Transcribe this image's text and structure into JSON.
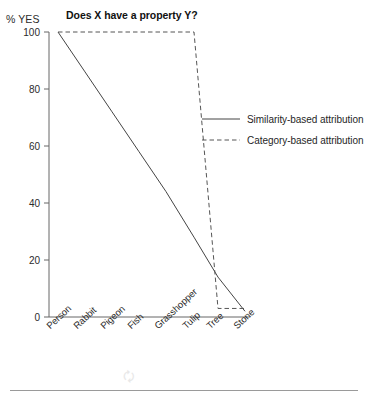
{
  "chart_data": {
    "type": "line",
    "title": "Does X have a property Y?",
    "ylabel": "% YES",
    "xlabel": "",
    "categories": [
      "Person",
      "Rabbit",
      "Pigeon",
      "Fish",
      "Grasshopper",
      "Tulip",
      "Tree",
      "Stone"
    ],
    "ylim": [
      0,
      100
    ],
    "yticks": [
      0,
      20,
      40,
      60,
      80,
      100
    ],
    "grid": false,
    "legend_position": "upper right",
    "series": [
      {
        "name": "Similarity-based attribution",
        "style": "solid",
        "color": "#444444",
        "values": [
          100,
          86,
          72,
          58,
          44,
          28,
          14,
          2
        ]
      },
      {
        "name": "Category-based attribution",
        "style": "dashed",
        "color": "#555555",
        "values": [
          100,
          100,
          100,
          100,
          100,
          100,
          3,
          3
        ]
      }
    ]
  },
  "figure": {
    "axis_unit_label": "% YES",
    "footer_ghost_text": ""
  },
  "legend": {
    "entries": [
      {
        "label": "Similarity-based attribution",
        "style": "solid"
      },
      {
        "label": "Category-based attribution",
        "style": "dashed"
      }
    ]
  }
}
